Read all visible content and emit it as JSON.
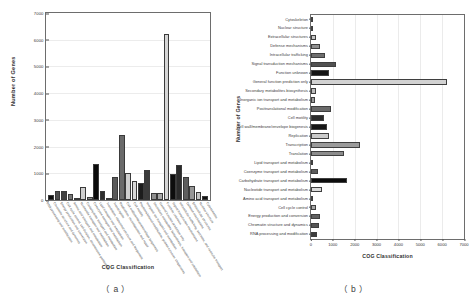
{
  "figure": {
    "panel_a_caption": "（ a ）",
    "panel_b_caption": "（ b ）"
  },
  "chart_data": [
    {
      "type": "bar",
      "panel": "a",
      "title": "",
      "xlabel": "COG Classification",
      "ylabel": "Number of Genes",
      "ylim": [
        0,
        7000
      ],
      "ytick_labels": [
        "7000",
        "6000",
        "5000",
        "4000",
        "3000",
        "2000",
        "1000",
        "0"
      ],
      "grid": true,
      "legend": "none",
      "categories": [
        "RNA processing and modification",
        "Chromatin structure and dynamics",
        "Energy production and conversion",
        "Cell cycle control, cell division, chromosome partitioning",
        "Amino acid transport and metabolism",
        "Nucleotide transport and metabolism",
        "Carbohydrate transport and metabolism",
        "Coenzyme transport and metabolism",
        "Lipid transport and metabolism",
        "Translation, ribosomal structure and biogenesis",
        "Transcription",
        "Replication, recombination and repair",
        "Cell wall/membrane/envelope biogenesis",
        "Cell motility",
        "Posttranslational modification, protein turnover, chaperones",
        "Inorganic ion transport and metabolism",
        "Secondary metabolites biosynthesis, transport and catabolism",
        "General function prediction only",
        "Function unknown",
        "Signal transduction mechanisms",
        "Intracellular trafficking, secretion, and vesicular transport",
        "Defense mechanisms",
        "Extracellular structures",
        "Nuclear structure",
        "Cytoskeleton"
      ],
      "values": [
        170,
        320,
        340,
        210,
        70,
        490,
        120,
        1340,
        350,
        90,
        880,
        2450,
        1000,
        720,
        620,
        1120,
        280,
        270,
        6200,
        980,
        1320,
        850,
        510,
        290,
        160
      ],
      "bar_colors": [
        "#101010",
        "#4f4f4f",
        "#404040",
        "#767676",
        "#bdbdbd",
        "#d0d0d0",
        "#8c8c8c",
        "#0b0b0b",
        "#2e2e2e",
        "#9a9a9a",
        "#5a5a5a",
        "#6a6a6a",
        "#cfcfcf",
        "#d8d8d8",
        "#1c1c1c",
        "#3a3a3a",
        "#8f8f8f",
        "#a8a8a8",
        "#d5d5d5",
        "#0d0d0d",
        "#2a2a2a",
        "#5e5e5e",
        "#969696",
        "#c4c4c4",
        "#121212"
      ]
    },
    {
      "type": "bar",
      "panel": "b",
      "orientation": "horizontal",
      "title": "",
      "xlabel": "COG Classification",
      "ylabel": "Number of Genes",
      "xlim": [
        0,
        7000
      ],
      "xtick_labels": [
        "0",
        "1000",
        "2000",
        "3000",
        "4000",
        "5000",
        "6000",
        "7000"
      ],
      "grid": true,
      "legend": "none",
      "categories": [
        "Cytoskeleton",
        "Nuclear structure",
        "Extracellular structures",
        "Defense mechanisms",
        "Intracellular trafficking",
        "Signal transduction mechanisms",
        "Function unknown",
        "General function prediction only",
        "Secondary metabolites biosynthesis",
        "Inorganic ion transport and metabolism",
        "Posttranslational modification",
        "Cell motility",
        "Cell wall/membrane/envelope biogenesis",
        "Replication",
        "Transcription",
        "Translation",
        "Lipid transport and metabolism",
        "Coenzyme transport and metabolism",
        "Carbohydrate transport and metabolism",
        "Nucleotide transport and metabolism",
        "Amino acid transport and metabolism",
        "Cell cycle control",
        "Energy production and conversion",
        "Chromatin structure and dynamics",
        "RNA processing and modification"
      ],
      "values": [
        60,
        20,
        230,
        400,
        640,
        1150,
        840,
        6200,
        220,
        200,
        900,
        610,
        740,
        840,
        2220,
        1530,
        90,
        300,
        1640,
        520,
        110,
        220,
        390,
        350,
        260
      ],
      "bar_colors": [
        "#1a1a1a",
        "#7a7a7a",
        "#c6c6c6",
        "#8f8f8f",
        "#6e6e6e",
        "#515151",
        "#141414",
        "#d2d2d2",
        "#bdbdbd",
        "#9d9d9d",
        "#6a6a6a",
        "#2b2b2b",
        "#161616",
        "#cacaca",
        "#9b9b9b",
        "#8c8c8c",
        "#2f2f2f",
        "#5c5c5c",
        "#0c0c0c",
        "#dcdcdc",
        "#727272",
        "#a6a6a6",
        "#5f5f5f",
        "#565656",
        "#3d3d3d"
      ]
    }
  ]
}
